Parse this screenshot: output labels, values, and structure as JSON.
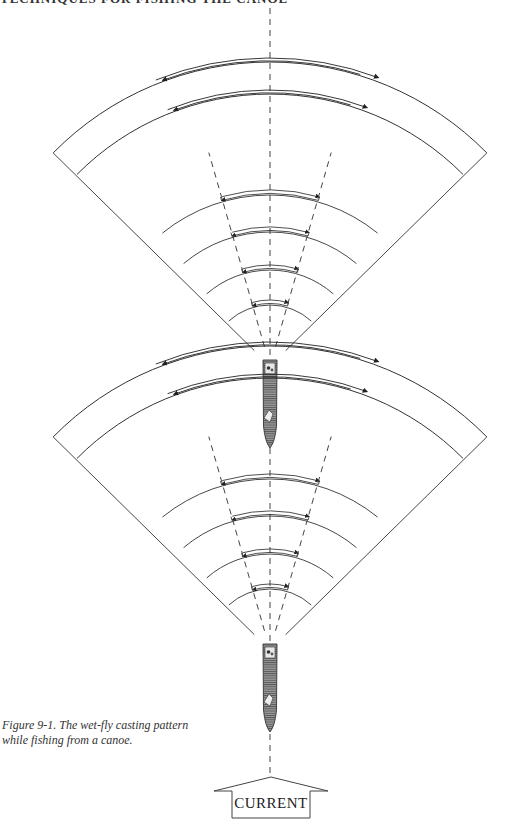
{
  "header": {
    "running_title": "TECHNIQUES FOR FISHING THE CANOE"
  },
  "figure": {
    "caption_line1": "Figure 9-1. The wet-fly casting pattern",
    "caption_line2": "while fishing from a canoe.",
    "current_label": "CURRENT",
    "colors": {
      "line": "#333333",
      "canoe_fill": "#8a8a8a",
      "canoe_stripe": "#5a5a5a",
      "background": "#ffffff"
    },
    "casting_positions": [
      {
        "name": "upper-position",
        "outer_arcs": 2,
        "inner_arcs": 4,
        "arrows_per_arc": 2
      },
      {
        "name": "lower-position",
        "outer_arcs": 2,
        "inner_arcs": 4,
        "arrows_per_arc": 2
      }
    ],
    "arrow_icon": "double-direction-arc-arrow",
    "canoe_icon": "canoe-with-anglers"
  }
}
